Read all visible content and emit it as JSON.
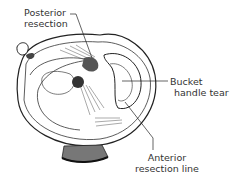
{
  "figure": {
    "labels": {
      "posterior_resection": [
        "Posterior",
        "resection"
      ],
      "bucket_handle_tear": [
        "Bucket",
        "handle tear"
      ],
      "anterior_resection_line": [
        "Anterior",
        "resection line"
      ]
    }
  }
}
